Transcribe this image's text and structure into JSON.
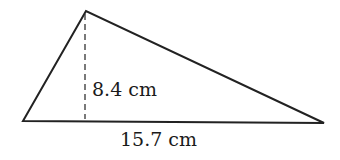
{
  "diagram": {
    "shape": "triangle",
    "vertices": {
      "apex": [
        86,
        11
      ],
      "bottom_left": [
        23,
        121
      ],
      "bottom_right": [
        324,
        123
      ]
    },
    "height_line": {
      "x": 85,
      "y1": 13,
      "y2": 119,
      "style": "dashed"
    },
    "height_label": "8.4 cm",
    "base_label": "15.7 cm",
    "stroke_color": "#222222"
  }
}
